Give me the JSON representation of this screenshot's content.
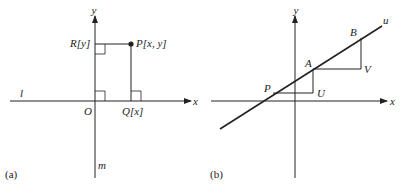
{
  "panel_a": {
    "caption": "(a)",
    "labels": {
      "y_axis": "y",
      "x_axis": "x",
      "line_l": "l",
      "line_m": "m",
      "origin": "O",
      "point_p": "P[x, y]",
      "point_r": "R[y]",
      "point_q": "Q[x]"
    }
  },
  "panel_b": {
    "caption": "(b)",
    "labels": {
      "y_axis": "y",
      "x_axis": "x",
      "line_u": "u",
      "point_p": "P",
      "point_a": "A",
      "point_b": "B",
      "point_u": "U",
      "point_v": "V"
    }
  },
  "colors": {
    "stroke": "#222222",
    "background": "#ffffff"
  }
}
